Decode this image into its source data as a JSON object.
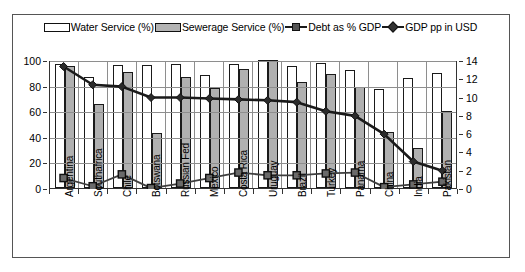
{
  "legend": {
    "items": [
      {
        "label": "Water Service (%)",
        "marker": "white-bar-swatch"
      },
      {
        "label": "Sewerage Service (%)",
        "marker": "grey-bar-swatch"
      },
      {
        "label": "Debt as % GDP",
        "marker": "square-line-marker"
      },
      {
        "label": "GDP pp in USD",
        "marker": "diamond-line-marker"
      }
    ]
  },
  "axes": {
    "left_ticks": [
      "0",
      "20",
      "40",
      "60",
      "80",
      "100"
    ],
    "right_ticks": [
      "0",
      "2",
      "4",
      "6",
      "8",
      "10",
      "12",
      "14"
    ]
  },
  "colors": {
    "water_bar": "#ffffff",
    "sewerage_bar": "#b0b0b0",
    "debt_line": "#3f3f3f",
    "gdp_line": "#1a1a1a",
    "gridline": "#8e8e8e",
    "axis": "#333333",
    "frame": "#555555"
  },
  "chart_data": {
    "type": "bar",
    "title": "",
    "subtitle": "",
    "xlabel": "",
    "ylabel": "",
    "y2label": "",
    "ylim": [
      0,
      100
    ],
    "y2lim": [
      0,
      14
    ],
    "grid": true,
    "legend_position": "top",
    "categories": [
      "Argentina",
      "Southafrica",
      "Chile",
      "Botswana",
      "Russian Fed",
      "Mexico",
      "Costa Rica",
      "Uruguay",
      "Brazil",
      "Turkey",
      "Panama",
      "China",
      "India",
      "Pakistan"
    ],
    "series": [
      {
        "name": "Water Service (%)",
        "type": "bar",
        "axis": "left",
        "values": [
          97,
          87,
          96,
          96,
          97,
          88,
          97,
          100,
          95,
          98,
          92,
          77,
          86,
          90
        ]
      },
      {
        "name": "Sewerage Service (%)",
        "type": "bar",
        "axis": "left",
        "values": [
          95,
          66,
          91,
          43,
          87,
          78,
          93,
          100,
          83,
          89,
          79,
          44,
          31,
          60
        ]
      },
      {
        "name": "Debt as % GDP",
        "type": "line",
        "axis": "right",
        "values": [
          1.2,
          0.3,
          1.6,
          0.1,
          0.6,
          1.2,
          1.8,
          1.5,
          1.5,
          1.7,
          1.8,
          0.2,
          0.5,
          0.8
        ]
      },
      {
        "name": "GDP pp in USD",
        "type": "line",
        "axis": "right",
        "values": [
          13.4,
          11.4,
          11.2,
          10.0,
          10.0,
          9.9,
          9.8,
          9.7,
          9.5,
          8.5,
          8.0,
          6.0,
          3.0,
          2.0
        ]
      }
    ]
  }
}
